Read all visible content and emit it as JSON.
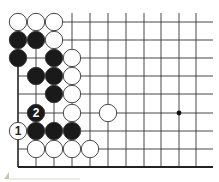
{
  "diagram": {
    "type": "go-board-fragment",
    "grid": {
      "columns_x": [
        18,
        36,
        54,
        72,
        90,
        108,
        126,
        144,
        161,
        179,
        196
      ],
      "rows_y": [
        22,
        40,
        58,
        76,
        94,
        113,
        131,
        149,
        167
      ],
      "top_y": 13,
      "right_x": 213,
      "bottom_edge_row": 8,
      "left_edge_col": 0,
      "line_color": "#333333",
      "edge_color": "#222222"
    },
    "star_points": [
      {
        "col": 9,
        "row": 5
      }
    ],
    "stones": [
      {
        "col": 0,
        "row": 0,
        "color": "white"
      },
      {
        "col": 1,
        "row": 0,
        "color": "white"
      },
      {
        "col": 2,
        "row": 0,
        "color": "white"
      },
      {
        "col": 0,
        "row": 1,
        "color": "black"
      },
      {
        "col": 1,
        "row": 1,
        "color": "black"
      },
      {
        "col": 2,
        "row": 1,
        "color": "white"
      },
      {
        "col": 0,
        "row": 2,
        "color": "black"
      },
      {
        "col": 2,
        "row": 2,
        "color": "black"
      },
      {
        "col": 3,
        "row": 2,
        "color": "white"
      },
      {
        "col": 1,
        "row": 3,
        "color": "black"
      },
      {
        "col": 2,
        "row": 3,
        "color": "black"
      },
      {
        "col": 3,
        "row": 3,
        "color": "white"
      },
      {
        "col": 2,
        "row": 4,
        "color": "black"
      },
      {
        "col": 3,
        "row": 4,
        "color": "white"
      },
      {
        "col": 1,
        "row": 5,
        "color": "black",
        "label": "2"
      },
      {
        "col": 3,
        "row": 5,
        "color": "white"
      },
      {
        "col": 5,
        "row": 5,
        "color": "white"
      },
      {
        "col": 0,
        "row": 6,
        "color": "white",
        "label": "1"
      },
      {
        "col": 1,
        "row": 6,
        "color": "black"
      },
      {
        "col": 2,
        "row": 6,
        "color": "black"
      },
      {
        "col": 3,
        "row": 6,
        "color": "black"
      },
      {
        "col": 1,
        "row": 7,
        "color": "white"
      },
      {
        "col": 2,
        "row": 7,
        "color": "white"
      },
      {
        "col": 3,
        "row": 7,
        "color": "white"
      },
      {
        "col": 4,
        "row": 7,
        "color": "white"
      }
    ],
    "move_labels": [
      "1",
      "2"
    ],
    "colors": {
      "black_stone": "#1a1a1a",
      "white_stone": "#ffffff",
      "stone_outline": "#333333"
    }
  }
}
